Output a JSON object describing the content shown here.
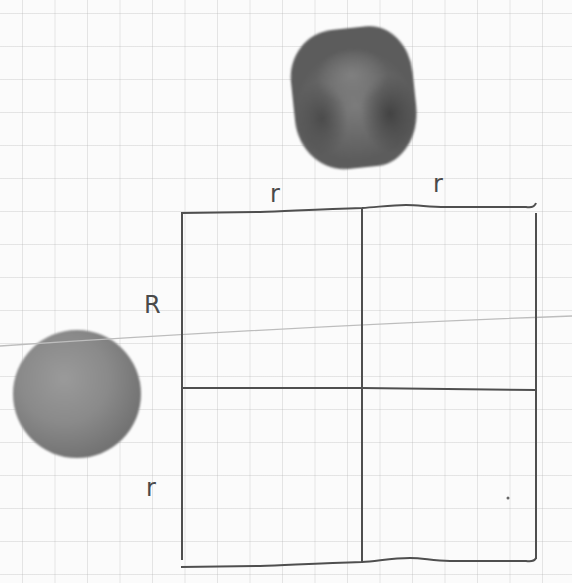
{
  "diagram": {
    "type": "hand-drawn geometry sketch on grid paper",
    "background": "grid paper",
    "objects": [
      {
        "name": "cube",
        "description": "dark gray rounded cube (die-like block)"
      },
      {
        "name": "sphere",
        "description": "gray sphere / ball"
      }
    ],
    "square": {
      "description": "large square divided into 2x2 sub-rectangles",
      "top_labels": [
        "r",
        "r"
      ],
      "left_labels": [
        "R",
        "r"
      ]
    },
    "colors": {
      "ink": "#4a4a4a",
      "grid": "#d6d6d6",
      "paper": "#fbfbfb",
      "stray_line": "#bdbdbd"
    }
  }
}
